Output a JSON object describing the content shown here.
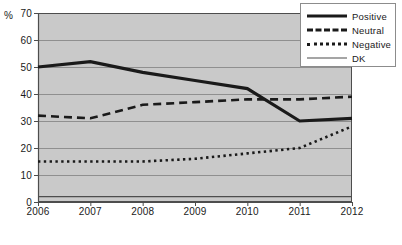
{
  "chart_data": {
    "type": "line",
    "title": "",
    "xlabel": "",
    "ylabel": "%",
    "categories": [
      "2006",
      "2007",
      "2008",
      "2009",
      "2010",
      "2011",
      "2012"
    ],
    "x": [
      2006,
      2007,
      2008,
      2009,
      2010,
      2011,
      2012
    ],
    "ylim": [
      0,
      70
    ],
    "y_ticks": [
      0,
      10,
      20,
      30,
      40,
      50,
      60,
      70
    ],
    "grid": true,
    "legend_position": "top-right",
    "plot_background": "#c9c9c9",
    "gridline_color": "#8f8f8f",
    "axis_color": "#4d4d4d",
    "series": [
      {
        "name": "Positive",
        "style": "solid-thick",
        "color": "#1a1a1a",
        "values": [
          50,
          52,
          48,
          45,
          42,
          30,
          31
        ]
      },
      {
        "name": "Neutral",
        "style": "dashed",
        "color": "#1a1a1a",
        "values": [
          32,
          31,
          36,
          37,
          38,
          38,
          39
        ]
      },
      {
        "name": "Negative",
        "style": "dotted",
        "color": "#1a1a1a",
        "values": [
          15,
          15,
          15,
          16,
          18,
          20,
          28
        ]
      },
      {
        "name": "DK",
        "style": "solid-thin",
        "color": "#4d4d4d",
        "values": [
          2,
          2,
          2,
          2,
          2,
          2,
          2
        ]
      }
    ]
  },
  "axis": {
    "unit_label": "%",
    "y_tick_labels": [
      "70",
      "60",
      "50",
      "40",
      "30",
      "20",
      "10",
      "0"
    ],
    "x_tick_labels": [
      "2006",
      "2007",
      "2008",
      "2009",
      "2010",
      "2011",
      "2012"
    ]
  },
  "legend": {
    "entries": [
      {
        "label": "Positive",
        "swatch": "solid-thick-line-icon"
      },
      {
        "label": "Neutral",
        "swatch": "dashed-line-icon"
      },
      {
        "label": "Negative",
        "swatch": "dotted-line-icon"
      },
      {
        "label": "DK",
        "swatch": "thin-line-icon"
      }
    ]
  }
}
